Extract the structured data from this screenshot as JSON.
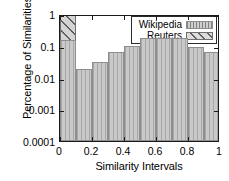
{
  "chart_data": {
    "type": "bar",
    "title": "",
    "xlabel": "Similarity Intervals",
    "ylabel": "Percentage of Similarities",
    "yscale": "log",
    "ylim": [
      0.0001,
      1
    ],
    "xlim": [
      0,
      1
    ],
    "grid": false,
    "legend_position": "top-right",
    "bin_width": 0.1,
    "bin_edges": [
      0,
      0.1,
      0.2,
      0.3,
      0.4,
      0.5,
      0.6,
      0.7,
      0.8,
      0.9,
      1.0
    ],
    "categories": [
      "0-0.1",
      "0.1-0.2",
      "0.2-0.3",
      "0.3-0.4",
      "0.4-0.5",
      "0.5-0.6",
      "0.6-0.7",
      "0.7-0.8",
      "0.8-0.9",
      "0.9-1.0"
    ],
    "series": [
      {
        "name": "Wikipedia",
        "fill": "vertical-hatch",
        "color": "#c9c9c9",
        "values": [
          0.15,
          0.018,
          0.03,
          0.065,
          0.1,
          0.17,
          0.17,
          0.17,
          0.09,
          0.065
        ]
      },
      {
        "name": "Reuters",
        "fill": "diagonal-hatch",
        "color": "#d4d4d4",
        "values": [
          1.0,
          0.018,
          0.0033,
          0.0012,
          0.0006,
          0.00028,
          0.00028,
          0.00018,
          0.00012,
          0.0001
        ]
      }
    ],
    "yticks": [
      {
        "value": 1,
        "label": "1"
      },
      {
        "value": 0.1,
        "label": "0.1"
      },
      {
        "value": 0.01,
        "label": "0.01"
      },
      {
        "value": 0.001,
        "label": "0.001"
      },
      {
        "value": 0.0001,
        "label": "0.0001"
      }
    ],
    "xticks": [
      {
        "value": 0,
        "label": "0"
      },
      {
        "value": 0.2,
        "label": "0.2"
      },
      {
        "value": 0.4,
        "label": "0.4"
      },
      {
        "value": 0.6,
        "label": "0.6"
      },
      {
        "value": 0.8,
        "label": "0.8"
      },
      {
        "value": 1,
        "label": "1"
      }
    ],
    "legend": [
      {
        "label": "Wikipedia",
        "swatch": "wiki"
      },
      {
        "label": "Reuters",
        "swatch": "reut"
      }
    ]
  }
}
